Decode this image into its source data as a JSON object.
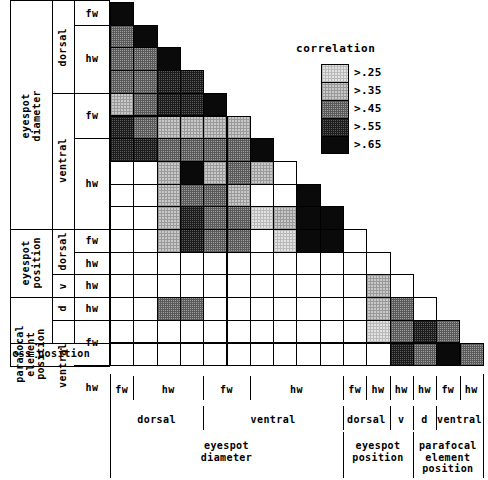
{
  "figure": {
    "kind": "correlation-matrix"
  },
  "legend": {
    "title": "correlation",
    "entries": [
      {
        "label": ">.25",
        "shade": 1,
        "color": "#e2e2e2"
      },
      {
        "label": ">.35",
        "shade": 2,
        "color": "#c9c9c9"
      },
      {
        "label": ">.45",
        "shade": 3,
        "color": "#9d9d9d"
      },
      {
        "label": ">.55",
        "shade": 4,
        "color": "#5c5c5c"
      },
      {
        "label": ">.65",
        "shade": 5,
        "color": "#0a0a0a"
      }
    ]
  },
  "row_labels": {
    "leaf": [
      "fw",
      "hw",
      "hw",
      "hw",
      "fw",
      "fw",
      "hw",
      "hw",
      "hw",
      "hw",
      "fw",
      "hw",
      "hw",
      "hw",
      "fw",
      "fw",
      "hw",
      "hw",
      "css position"
    ],
    "leaf_blocks": [
      {
        "text": "fw",
        "rows": 1
      },
      {
        "text": "hw",
        "rows": 3
      },
      {
        "text": "fw",
        "rows": 2
      },
      {
        "text": "hw",
        "rows": 4
      },
      {
        "text": "fw",
        "rows": 1
      },
      {
        "text": "hw",
        "rows": 1
      },
      {
        "text": "hw",
        "rows": 1
      },
      {
        "text": "hw",
        "rows": 1
      },
      {
        "text": "fw",
        "rows": 2
      },
      {
        "text": "hw",
        "rows": 2
      }
    ],
    "mid_blocks": [
      {
        "text": "dorsal",
        "rows": 4
      },
      {
        "text": "ventral",
        "rows": 6
      },
      {
        "text": "dorsal",
        "rows": 2
      },
      {
        "text": "v",
        "rows": 1
      },
      {
        "text": "d",
        "rows": 1
      },
      {
        "text": "ventral",
        "rows": 4
      }
    ],
    "outer_blocks": [
      {
        "text": "eyespot\ndiameter",
        "rows": 10
      },
      {
        "text": "eyespot\nposition",
        "rows": 3
      },
      {
        "text": "parafocal\nelement\nposition",
        "rows": 5
      }
    ],
    "bottom_row": "css position"
  },
  "col_labels": {
    "leaf": [
      {
        "text": "fw",
        "cols": 1
      },
      {
        "text": "hw",
        "cols": 3
      },
      {
        "text": "fw",
        "cols": 2
      },
      {
        "text": "hw",
        "cols": 4
      },
      {
        "text": "fw",
        "cols": 1
      },
      {
        "text": "hw",
        "cols": 1
      },
      {
        "text": "hw",
        "cols": 1
      },
      {
        "text": "hw",
        "cols": 1
      },
      {
        "text": "fw",
        "cols": 1
      },
      {
        "text": "hw",
        "cols": 1
      }
    ],
    "mid": [
      {
        "text": "dorsal",
        "cols": 4
      },
      {
        "text": "ventral",
        "cols": 6
      },
      {
        "text": "dorsal",
        "cols": 2
      },
      {
        "text": "v",
        "cols": 1
      },
      {
        "text": "d",
        "cols": 1
      },
      {
        "text": "ventral",
        "cols": 2
      }
    ],
    "outer": [
      {
        "text": "eyespot\ndiameter",
        "cols": 10
      },
      {
        "text": "eyespot\nposition",
        "cols": 3
      },
      {
        "text": "parafocal\nelement\nposition",
        "cols": 3
      }
    ]
  },
  "chart_data": {
    "type": "heatmap",
    "title": "",
    "legend_title": "correlation",
    "legend_position": "upper-right",
    "shade_levels": [
      {
        "code": 0,
        "meaning": "<=.25 (blank)"
      },
      {
        "code": 1,
        "meaning": ">.25"
      },
      {
        "code": 2,
        "meaning": ">.35"
      },
      {
        "code": 3,
        "meaning": ">.45"
      },
      {
        "code": 4,
        "meaning": ">.55"
      },
      {
        "code": 5,
        "meaning": ">.65"
      }
    ],
    "n_rows": 16,
    "n_cols": 16,
    "triangular": "lower",
    "variables": [
      "eyespot diameter dorsal fw",
      "eyespot diameter dorsal hw 1",
      "eyespot diameter dorsal hw 2",
      "eyespot diameter dorsal hw 3",
      "eyespot diameter ventral fw 1",
      "eyespot diameter ventral fw 2",
      "eyespot diameter ventral hw 1",
      "eyespot diameter ventral hw 2",
      "eyespot diameter ventral hw 3",
      "eyespot diameter ventral hw 4",
      "eyespot position dorsal fw",
      "eyespot position dorsal hw",
      "eyespot position ventral hw",
      "parafocal element position dorsal hw",
      "parafocal element position ventral fw",
      "parafocal element position ventral hw"
    ],
    "matrix": [
      [
        5
      ],
      [
        3,
        5
      ],
      [
        3,
        3,
        5
      ],
      [
        3,
        3,
        4,
        4
      ],
      [
        2,
        3,
        4,
        4,
        5
      ],
      [
        4,
        3,
        2,
        2,
        2,
        2
      ],
      [
        4,
        4,
        3,
        3,
        3,
        3,
        5
      ],
      [
        0,
        0,
        2,
        5,
        2,
        3,
        2,
        0
      ],
      [
        0,
        0,
        2,
        3,
        3,
        2,
        0,
        0,
        5
      ],
      [
        0,
        0,
        2,
        4,
        3,
        3,
        1,
        2,
        5,
        5
      ],
      [
        0,
        0,
        2,
        4,
        3,
        3,
        0,
        1,
        5,
        5,
        0
      ],
      [
        0,
        0,
        0,
        0,
        0,
        0,
        0,
        0,
        0,
        0,
        0,
        0
      ],
      [
        0,
        0,
        0,
        0,
        0,
        0,
        0,
        0,
        0,
        0,
        0,
        2,
        0
      ],
      [
        0,
        0,
        3,
        3,
        0,
        0,
        0,
        0,
        0,
        0,
        0,
        2,
        3,
        0
      ],
      [
        0,
        0,
        0,
        0,
        0,
        0,
        0,
        0,
        0,
        0,
        0,
        1,
        3,
        4,
        3
      ],
      [
        0,
        0,
        0,
        0,
        0,
        0,
        0,
        0,
        0,
        0,
        0,
        0,
        4,
        3,
        5,
        3
      ]
    ]
  }
}
